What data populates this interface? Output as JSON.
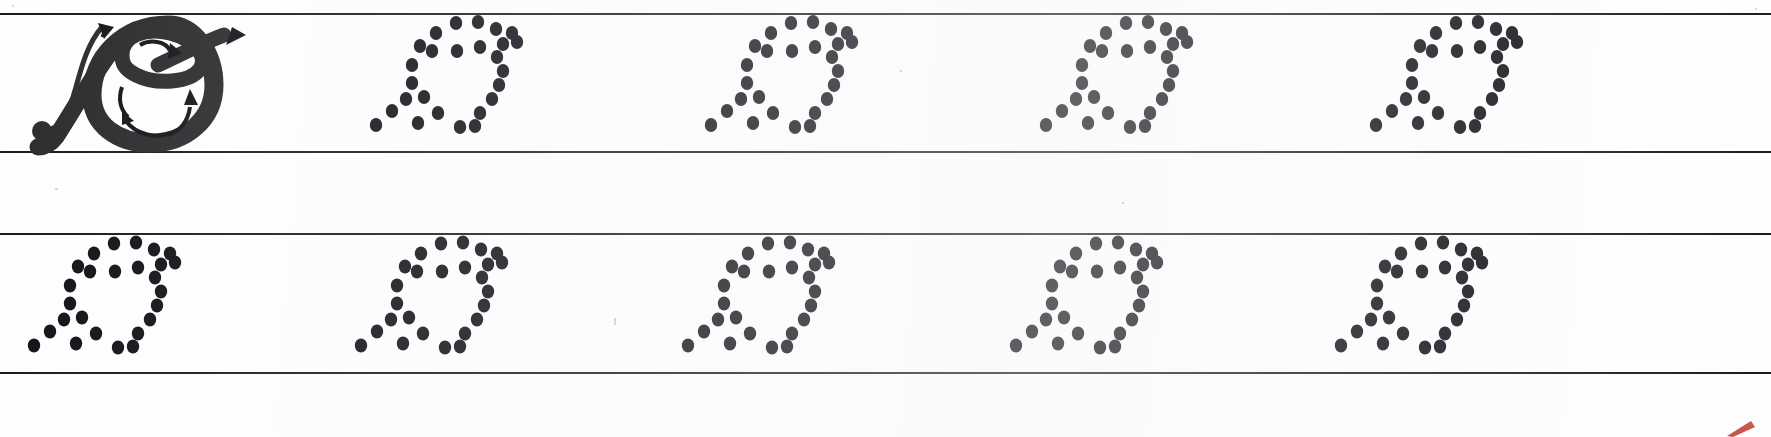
{
  "worksheet": {
    "kind": "cursive-handwriting-tracing-worksheet",
    "letter": "cursive capital O / Q",
    "ink_color": "#111118",
    "rule_color": "#1a1a22",
    "paper_color": "#fefefe",
    "page_width": 1771,
    "page_height": 437,
    "rows": [
      {
        "name": "row-1",
        "top": 13,
        "bottom": 153,
        "items": [
          {
            "type": "model-letter",
            "x": 18,
            "width": 300,
            "label": "model letter with stroke-order arrows"
          },
          {
            "type": "dotted-letter",
            "x": 360,
            "width": 190,
            "label": "dotted tracing letter 1"
          },
          {
            "type": "dotted-letter",
            "x": 695,
            "width": 190,
            "label": "dotted tracing letter 2"
          },
          {
            "type": "dotted-letter",
            "x": 1030,
            "width": 190,
            "label": "dotted tracing letter 3"
          },
          {
            "type": "dotted-letter",
            "x": 1360,
            "width": 190,
            "label": "dotted tracing letter 4"
          }
        ]
      },
      {
        "name": "row-2",
        "top": 233,
        "bottom": 374,
        "items": [
          {
            "type": "dotted-letter",
            "x": 18,
            "width": 190,
            "label": "dotted tracing letter 5"
          },
          {
            "type": "dotted-letter",
            "x": 345,
            "width": 190,
            "label": "dotted tracing letter 6"
          },
          {
            "type": "dotted-letter",
            "x": 672,
            "width": 190,
            "label": "dotted tracing letter 7"
          },
          {
            "type": "dotted-letter",
            "x": 1000,
            "width": 190,
            "label": "dotted tracing letter 8"
          },
          {
            "type": "dotted-letter",
            "x": 1325,
            "width": 190,
            "label": "dotted tracing letter 9"
          }
        ]
      }
    ],
    "dot_pattern": {
      "dot_radius_x": 6.2,
      "dot_radius_y": 7.0,
      "viewbox": [
        0,
        0,
        190,
        140
      ],
      "dots": [
        [
          96,
          10
        ],
        [
          118,
          9
        ],
        [
          76,
          20
        ],
        [
          136,
          16
        ],
        [
          152,
          20
        ],
        [
          60,
          33
        ],
        [
          72,
          38
        ],
        [
          143,
          31
        ],
        [
          157,
          29
        ],
        [
          97,
          38
        ],
        [
          120,
          34
        ],
        [
          137,
          44
        ],
        [
          52,
          52
        ],
        [
          143,
          58
        ],
        [
          52,
          70
        ],
        [
          139,
          72
        ],
        [
          46,
          86
        ],
        [
          64,
          84
        ],
        [
          132,
          86
        ],
        [
          32,
          98
        ],
        [
          78,
          100
        ],
        [
          120,
          100
        ],
        [
          16,
          112
        ],
        [
          58,
          110
        ],
        [
          100,
          114
        ],
        [
          115,
          113
        ]
      ]
    },
    "model_letter": {
      "stroke_color": "#2e2b2e",
      "arrow_color": "#17141a",
      "start_dot": {
        "cx": 24,
        "cy": 118,
        "r": 10
      },
      "arrows": [
        {
          "name": "entry-stroke-up-arrow"
        },
        {
          "name": "crossbar-out-arrow"
        },
        {
          "name": "inner-loop-arrow"
        },
        {
          "name": "bowl-down-arrow"
        },
        {
          "name": "bowl-up-arrow"
        }
      ]
    },
    "specks": [
      {
        "x": 12,
        "y": 5,
        "w": 2,
        "h": 2
      },
      {
        "x": 1755,
        "y": 8,
        "w": 2,
        "h": 2
      },
      {
        "x": 55,
        "y": 188,
        "w": 3,
        "h": 2
      },
      {
        "x": 614,
        "y": 318,
        "w": 2,
        "h": 7
      },
      {
        "x": 1122,
        "y": 202,
        "w": 2,
        "h": 2
      },
      {
        "x": 900,
        "y": 70,
        "w": 2,
        "h": 2
      }
    ],
    "corner_mark": {
      "color": "#c0392b",
      "label": "red scan edge mark"
    }
  }
}
